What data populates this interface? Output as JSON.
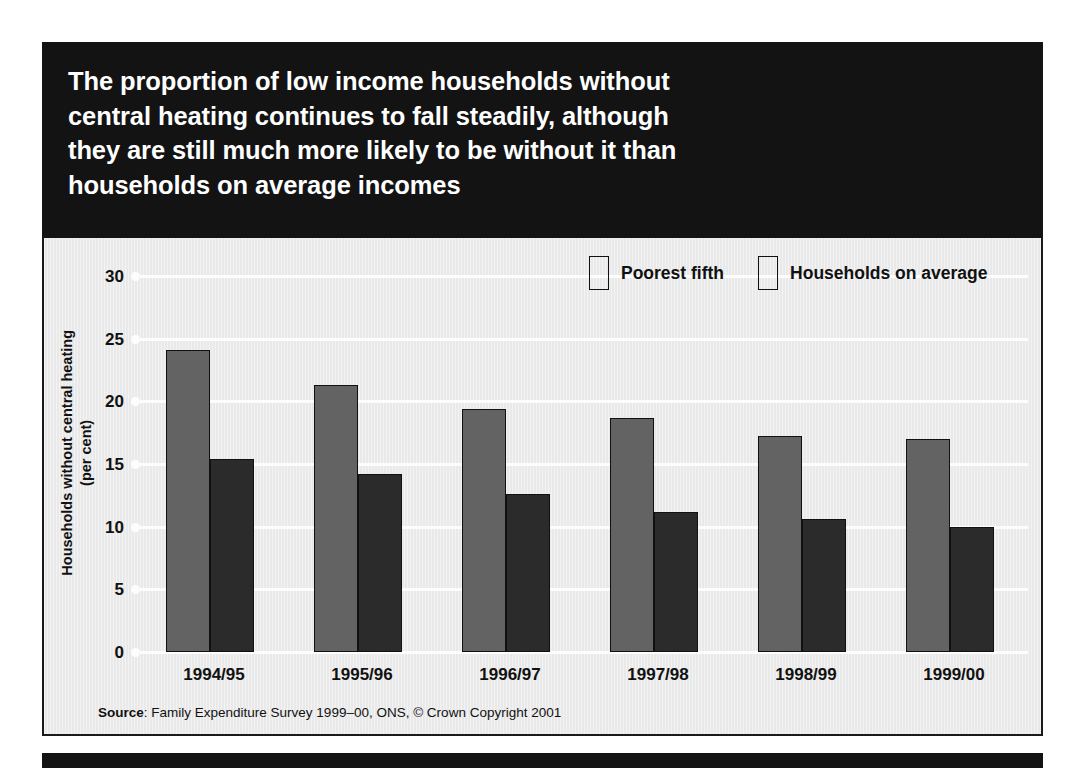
{
  "headline": {
    "lines": [
      "The proportion of low income households without",
      "central heating continues to fall steadily, although",
      "they are still much more likely to be without it than",
      "households on average incomes"
    ]
  },
  "source": {
    "label": "Source",
    "separator": ": ",
    "text": "Family Expenditure Survey 1999–00, ONS, © Crown Copyright 2001"
  },
  "colors": {
    "poorest_fifth": "#636363",
    "households_on_average": "#2b2b2b",
    "panel_background": "#e9e9e9",
    "headline_background": "#131313",
    "gridline": "#fdfdfd",
    "text": "#111111"
  },
  "chart_data": {
    "type": "bar",
    "title": "The proportion of low income households without central heating continues to fall steadily, although they are still much more likely to be without it than households on average incomes",
    "xlabel": "",
    "ylabel": "Households without central heating (per cent)",
    "ylabel_lines": [
      "Households without central heating",
      "(per cent)"
    ],
    "categories": [
      "1994/95",
      "1995/96",
      "1996/97",
      "1997/98",
      "1998/99",
      "1999/00"
    ],
    "series": [
      {
        "name": "Poorest fifth",
        "color": "#636363",
        "values": [
          24.1,
          21.3,
          19.4,
          18.7,
          17.2,
          17.0
        ]
      },
      {
        "name": "Households on average",
        "color": "#2b2b2b",
        "values": [
          15.4,
          14.2,
          12.6,
          11.2,
          10.6,
          10.0
        ]
      }
    ],
    "ylim": [
      0,
      30
    ],
    "yticks": [
      0,
      5,
      10,
      15,
      20,
      25,
      30
    ],
    "ytick_labels": [
      "0",
      "5",
      "10",
      "15",
      "20",
      "25",
      "30"
    ],
    "grid": true,
    "legend_position": "top-right"
  }
}
